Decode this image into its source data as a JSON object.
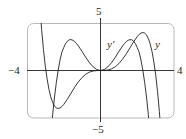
{
  "chart_data": {
    "type": "line",
    "title": "",
    "xlabel": "",
    "ylabel": "",
    "xlim": [
      -4,
      4
    ],
    "ylim": [
      -5,
      5
    ],
    "grid": false,
    "legend": "inline labels near curves",
    "tick_labels": {
      "x_min": "−4",
      "x_max": "4",
      "y_max": "5",
      "y_min": "−5"
    },
    "series": [
      {
        "name": "y",
        "label": "y",
        "x": [
          -3.6,
          -3.5,
          -3.4,
          -3.3,
          -3.2,
          -3.1,
          -3.0,
          -2.9,
          -2.8,
          -2.7,
          -2.6,
          -2.5,
          -2.4,
          -2.3,
          -2.2,
          -2.1,
          -2.0,
          -1.8,
          -1.6,
          -1.4,
          -1.2,
          -1.0,
          -0.8,
          -0.6,
          -0.4,
          -0.2,
          0,
          0.2,
          0.4,
          0.6,
          0.8,
          1.0,
          1.2,
          1.4,
          1.6,
          1.8,
          2.0,
          2.1,
          2.2,
          2.3,
          2.4,
          2.5,
          2.6,
          2.7,
          2.8,
          2.9,
          3.0,
          3.1,
          3.2,
          3.3,
          3.4,
          3.5,
          3.6
        ],
        "values": [
          17.97,
          13.5,
          10.03,
          6.9,
          4.33,
          2.2,
          0.46,
          -0.9,
          -2.0,
          -2.8,
          -3.36,
          -3.75,
          -3.94,
          -4.0,
          -3.94,
          -3.8,
          -3.58,
          -3.02,
          -2.38,
          -1.75,
          -1.19,
          -0.73,
          -0.39,
          -0.17,
          -0.05,
          -0.007,
          0,
          0.007,
          0.05,
          0.17,
          0.39,
          0.73,
          1.19,
          1.75,
          2.38,
          3.02,
          3.58,
          3.8,
          3.94,
          4.0,
          3.94,
          3.75,
          3.36,
          2.8,
          2.0,
          0.9,
          -0.46,
          -2.2,
          -4.33,
          -6.9,
          -10.03,
          -13.5,
          -17.97
        ],
        "color": "#231f20"
      },
      {
        "name": "y'",
        "label": "y′",
        "x": [
          -3.0,
          -2.9,
          -2.8,
          -2.7,
          -2.6,
          -2.5,
          -2.4,
          -2.3,
          -2.2,
          -2.1,
          -2.0,
          -1.9,
          -1.8,
          -1.7,
          -1.6,
          -1.5,
          -1.4,
          -1.3,
          -1.2,
          -1.0,
          -0.8,
          -0.6,
          -0.4,
          -0.2,
          0,
          0.2,
          0.4,
          0.6,
          0.8,
          1.0,
          1.2,
          1.3,
          1.4,
          1.5,
          1.6,
          1.7,
          1.8,
          1.9,
          2.0,
          2.1,
          2.2,
          2.3,
          2.4,
          2.5,
          2.6,
          2.7,
          2.8,
          2.9,
          3.0
        ],
        "values": [
          -15.5,
          -12.1,
          -9.3,
          -7.0,
          -4.65,
          -2.79,
          -1.26,
          0.03,
          1.1,
          1.93,
          2.4,
          2.82,
          3.09,
          3.23,
          3.25,
          3.18,
          3.04,
          2.83,
          2.58,
          2.0,
          1.38,
          0.82,
          0.38,
          0.1,
          0,
          0.1,
          0.38,
          0.82,
          1.38,
          2.0,
          2.58,
          2.83,
          3.04,
          3.18,
          3.25,
          3.23,
          3.09,
          2.82,
          2.4,
          1.93,
          1.1,
          0.03,
          -1.26,
          -2.79,
          -4.65,
          -7.0,
          -9.3,
          -12.1,
          -15.5
        ],
        "color": "#231f20"
      }
    ],
    "annotations": [
      {
        "text": "y′",
        "x": 0.45,
        "y": 2.9
      },
      {
        "text": "y",
        "x": 3.05,
        "y": 2.9
      }
    ]
  },
  "labels": {
    "y_max": "5",
    "y_min": "−5",
    "x_min": "−4",
    "x_max": "4",
    "curve_y_prime": "y′",
    "curve_y": "y"
  }
}
